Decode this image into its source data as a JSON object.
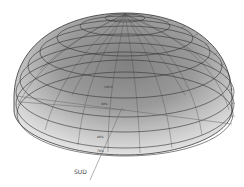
{
  "diagram": {
    "type": "sky-dome-hemisphere",
    "direction_label": "SUD",
    "ring_labels": [
      "100%",
      "90%",
      "80%",
      "70%"
    ],
    "rim_tick_count": 11,
    "colors": {
      "zenith": "#7a7a7a",
      "mid": "#a8a8a8",
      "horizon": "#e6e6e6",
      "grid_line": "#333333",
      "background": "#ffffff"
    }
  }
}
